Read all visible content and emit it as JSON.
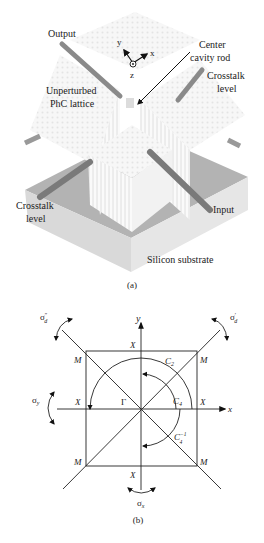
{
  "figure_a": {
    "caption": "(a)",
    "labels": {
      "output": "Output",
      "center_cavity_line1": "Center",
      "center_cavity_line2": "cavity rod",
      "crosstalk_right_line1": "Crosstalk",
      "crosstalk_right_line2": "level",
      "unperturbed_line1": "Unperturbed",
      "unperturbed_line2": "PhC lattice",
      "crosstalk_left_line1": "Crosstalk",
      "crosstalk_left_line2": "level",
      "input": "Input",
      "substrate": "Silicon substrate"
    },
    "axes": {
      "x": "x",
      "y": "y",
      "z": "z"
    },
    "colors": {
      "substrate_top": "#a9a9a9",
      "substrate_side": "#d4d4d4",
      "waveguide": "#7a7a7a",
      "lattice": "#f4f4f4"
    }
  },
  "figure_b": {
    "caption": "(b)",
    "axes": {
      "x": "x",
      "y": "y"
    },
    "points": {
      "gamma": "Γ",
      "x_point": "X",
      "m_point": "M"
    },
    "operations": {
      "c2": "C",
      "c2_sub": "2",
      "c4": "C",
      "c4_sub": "4",
      "c4inv": "C",
      "c4inv_sup": "−1",
      "c4inv_sub": "4",
      "sigma_x": "σ",
      "sigma_x_sub": "x",
      "sigma_y": "σ",
      "sigma_y_sub": "y",
      "sigma_d1": "σ",
      "sigma_d1_sub": "d",
      "sigma_d1_sup": "′",
      "sigma_d2": "σ",
      "sigma_d2_sub": "d",
      "sigma_d2_sup": "″"
    }
  }
}
